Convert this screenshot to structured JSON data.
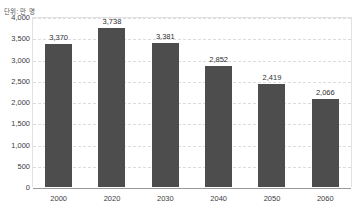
{
  "caption": "단위: 만 명",
  "chart_data": {
    "type": "bar",
    "title": "",
    "subtitle": "",
    "xlabel": "",
    "ylabel": "",
    "unit_note": "단위: 만 명",
    "categories": [
      "2000",
      "2020",
      "2030",
      "2040",
      "2050",
      "2060"
    ],
    "values": [
      3370,
      3738,
      3381,
      2852,
      2419,
      2066
    ],
    "value_labels": [
      "3,370",
      "3,738",
      "3,381",
      "2,852",
      "2,419",
      "2,066"
    ],
    "ylim": [
      0,
      4000
    ],
    "ytick_step": 500,
    "ytick_labels": [
      "4,000",
      "3,500",
      "3,000",
      "2,500",
      "2,000",
      "1,500",
      "1,000",
      "500",
      "0"
    ],
    "ytick_values": [
      4000,
      3500,
      3000,
      2500,
      2000,
      1500,
      1000,
      500,
      0
    ],
    "grid": true,
    "grid_axis": "y",
    "legend": false,
    "legend_position": "none",
    "series": [
      {
        "name": "population",
        "values": [
          3370,
          3738,
          3381,
          2852,
          2419,
          2066
        ],
        "color": "#4d4d4d"
      }
    ],
    "colors": {
      "bar": "#4d4d4d",
      "grid": "#dcdcdc",
      "axis": "#9a9a9a",
      "text": "#3d3d3d",
      "background": "#ffffff"
    }
  }
}
